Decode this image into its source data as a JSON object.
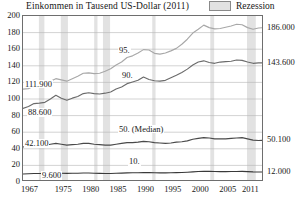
{
  "chart_data": {
    "type": "line",
    "title": "Einkommen in Tausend US-Dollar (2011)",
    "xlabel": "",
    "ylabel": "",
    "ylim": [
      0,
      200
    ],
    "xlim": [
      1967,
      2011
    ],
    "grid": true,
    "legend_position": "top-right",
    "legend": [
      {
        "label": "Rezession",
        "color": "#e2e2e2",
        "kind": "band"
      }
    ],
    "yticks": [
      "0",
      "20",
      "40",
      "60",
      "80",
      "100",
      "120",
      "140",
      "160",
      "180",
      "200"
    ],
    "ytick_values": [
      0,
      20,
      40,
      60,
      80,
      100,
      120,
      140,
      160,
      180,
      200
    ],
    "xticks": [
      "1967",
      "1975",
      "1980",
      "1985",
      "1990",
      "1995",
      "2000",
      "2005",
      "2011"
    ],
    "xtick_values": [
      1967,
      1975,
      1980,
      1985,
      1990,
      1995,
      2000,
      2005,
      2011
    ],
    "right_axis_labels": [
      {
        "text": "186.000",
        "value": 186.0
      },
      {
        "text": "143.600",
        "value": 143.6
      },
      {
        "text": "50.100",
        "value": 50.1
      },
      {
        "text": "12.000",
        "value": 12.0
      }
    ],
    "start_value_labels": [
      {
        "text": "111.900",
        "value": 111.9,
        "series": "95."
      },
      {
        "text": "88.600",
        "value": 88.6,
        "series": "90."
      },
      {
        "text": "42.100",
        "value": 42.1,
        "series": "50. (Median)"
      },
      {
        "text": "9.600",
        "value": 9.6,
        "series": "10."
      }
    ],
    "series_annotations": [
      {
        "text": "95."
      },
      {
        "text": "90."
      },
      {
        "text": "50. (Median)"
      },
      {
        "text": "10."
      }
    ],
    "x": [
      1967,
      1968,
      1969,
      1970,
      1971,
      1972,
      1973,
      1974,
      1975,
      1976,
      1977,
      1978,
      1979,
      1980,
      1981,
      1982,
      1983,
      1984,
      1985,
      1986,
      1987,
      1988,
      1989,
      1990,
      1991,
      1992,
      1993,
      1994,
      1995,
      1996,
      1997,
      1998,
      1999,
      2000,
      2001,
      2002,
      2003,
      2004,
      2005,
      2006,
      2007,
      2008,
      2009,
      2010,
      2011
    ],
    "series": [
      {
        "name": "95.",
        "color": "#a8a8a8",
        "end_label": "186.000",
        "start_label": "111.900",
        "values": [
          111.9,
          112.5,
          116.0,
          116.5,
          118.0,
          121.5,
          124.5,
          123.0,
          121.5,
          124.5,
          127.5,
          131.0,
          131.5,
          130.5,
          131.0,
          133.5,
          136.5,
          141.0,
          144.5,
          150.0,
          152.0,
          155.5,
          159.5,
          159.0,
          155.0,
          154.0,
          155.5,
          158.0,
          161.0,
          166.0,
          172.0,
          179.5,
          184.0,
          189.0,
          186.0,
          184.5,
          185.0,
          186.5,
          188.0,
          190.0,
          189.5,
          186.0,
          184.0,
          185.5,
          186.0
        ]
      },
      {
        "name": "90.",
        "color": "#6b6b6b",
        "end_label": "143.600",
        "start_label": "88.600",
        "values": [
          88.6,
          91.0,
          94.5,
          95.0,
          96.0,
          100.0,
          104.5,
          101.0,
          98.5,
          101.0,
          103.0,
          106.5,
          107.5,
          106.5,
          106.0,
          107.0,
          108.5,
          112.0,
          114.5,
          118.5,
          120.5,
          122.5,
          126.5,
          123.5,
          122.0,
          121.5,
          122.5,
          125.5,
          128.5,
          132.0,
          136.0,
          141.0,
          144.5,
          146.0,
          144.0,
          143.0,
          144.5,
          145.0,
          145.5,
          147.0,
          146.5,
          144.5,
          143.0,
          143.5,
          143.6
        ]
      },
      {
        "name": "50. (Median)",
        "color": "#4a4a4a",
        "end_label": "50.100",
        "start_label": "42.100",
        "values": [
          42.1,
          43.5,
          45.0,
          44.5,
          44.0,
          45.5,
          46.5,
          45.5,
          44.5,
          45.0,
          45.5,
          46.5,
          46.5,
          45.5,
          45.0,
          44.5,
          44.5,
          45.5,
          46.5,
          47.5,
          47.5,
          48.0,
          49.0,
          48.5,
          47.5,
          47.0,
          46.5,
          47.0,
          48.0,
          48.5,
          49.5,
          51.5,
          52.5,
          53.5,
          53.0,
          52.0,
          52.0,
          52.0,
          52.5,
          53.0,
          53.5,
          52.0,
          50.5,
          50.0,
          50.1
        ]
      },
      {
        "name": "10.",
        "color": "#3a3a3a",
        "end_label": "12.000",
        "start_label": "9.600",
        "values": [
          9.6,
          9.9,
          10.3,
          10.3,
          10.2,
          10.4,
          10.8,
          10.6,
          10.4,
          10.5,
          10.6,
          10.9,
          10.9,
          10.6,
          10.4,
          10.2,
          10.3,
          10.5,
          10.7,
          11.0,
          11.1,
          11.2,
          11.4,
          11.3,
          11.1,
          11.0,
          11.0,
          11.1,
          11.3,
          11.5,
          11.8,
          12.2,
          12.6,
          12.9,
          12.8,
          12.6,
          12.5,
          12.5,
          12.6,
          12.7,
          12.8,
          12.5,
          12.2,
          12.1,
          12.0
        ]
      }
    ],
    "recession_bands": [
      {
        "start": 1969.9,
        "end": 1970.9
      },
      {
        "start": 1973.9,
        "end": 1975.2
      },
      {
        "start": 1980.0,
        "end": 1980.6
      },
      {
        "start": 1981.6,
        "end": 1982.9
      },
      {
        "start": 1990.6,
        "end": 1991.2
      },
      {
        "start": 2001.2,
        "end": 2001.9
      },
      {
        "start": 2007.9,
        "end": 2009.5
      }
    ],
    "band_color": "#e2e2e2"
  }
}
